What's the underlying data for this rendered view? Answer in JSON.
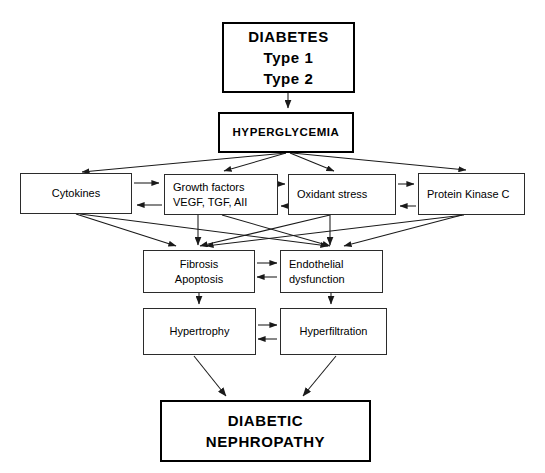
{
  "diagram": {
    "stroke_color": "#2b2b2b",
    "background_color": "#ffffff",
    "text_color": "#000000",
    "nodes": {
      "diabetes": {
        "lines": [
          "DIABETES",
          "Type 1",
          "Type 2"
        ]
      },
      "hyperglycemia": {
        "lines": [
          "HYPERGLYCEMIA"
        ]
      },
      "cytokines": {
        "lines": [
          "Cytokines"
        ]
      },
      "growth_factors": {
        "lines": [
          "Growth factors",
          "VEGF, TGF, AII"
        ]
      },
      "oxidant_stress": {
        "lines": [
          "Oxidant stress"
        ]
      },
      "protein_kinase_c": {
        "lines": [
          "Protein Kinase C"
        ]
      },
      "fibrosis": {
        "lines": [
          "Fibrosis",
          "Apoptosis"
        ]
      },
      "endothelial": {
        "lines": [
          "Endothelial",
          "dysfunction"
        ]
      },
      "hypertrophy": {
        "lines": [
          "Hypertrophy"
        ]
      },
      "hyperfiltration": {
        "lines": [
          "Hyperfiltration"
        ]
      },
      "nephropathy": {
        "lines": [
          "DIABETIC",
          "NEPHROPATHY"
        ]
      }
    }
  }
}
